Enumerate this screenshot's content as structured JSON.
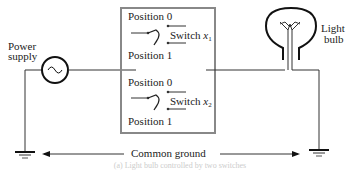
{
  "diagram": {
    "power_supply": {
      "label_line1": "Power",
      "label_line2": "supply",
      "icon": "ac-source-icon"
    },
    "switch_box": {
      "switch1": {
        "position0": "Position 0",
        "position1": "Position 1",
        "label": "Switch ",
        "var": "x",
        "sub": "1"
      },
      "switch2": {
        "position0": "Position 0",
        "position1": "Position 1",
        "label": "Switch ",
        "var": "x",
        "sub": "2"
      },
      "border_color": "#888888"
    },
    "light_bulb": {
      "label_line1": "Light",
      "label_line2": "bulb",
      "icon": "light-bulb-icon"
    },
    "ground": {
      "label": "Common ground",
      "icon": "ground-icon"
    },
    "caption": "(a) Light bulb controlled by two switches"
  }
}
